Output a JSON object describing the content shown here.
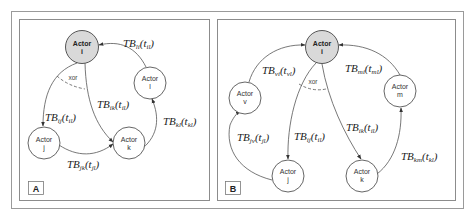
{
  "figure": {
    "panels": [
      {
        "id": "A",
        "tag": "A",
        "xor_label": "xor",
        "nodes": [
          {
            "id": "i",
            "line1": "Actor",
            "line2": "i",
            "focal": true
          },
          {
            "id": "l",
            "line1": "Actor",
            "line2": "l",
            "focal": false
          },
          {
            "id": "j",
            "line1": "Actor",
            "line2": "j",
            "focal": false
          },
          {
            "id": "k",
            "line1": "Actor",
            "line2": "k",
            "focal": false
          }
        ],
        "edges": [
          {
            "from": "l",
            "to": "i",
            "base": "TB",
            "sub": "li",
            "arg": "t",
            "argsub": "il"
          },
          {
            "from": "i",
            "to": "j",
            "base": "TB",
            "sub": "ij",
            "arg": "t",
            "argsub": "il"
          },
          {
            "from": "i",
            "to": "k",
            "base": "TB",
            "sub": "ik",
            "arg": "t",
            "argsub": "il"
          },
          {
            "from": "j",
            "to": "k",
            "base": "TB",
            "sub": "jk",
            "arg": "t",
            "argsub": "jl"
          },
          {
            "from": "k",
            "to": "l",
            "base": "TB",
            "sub": "kl",
            "arg": "t",
            "argsub": "kl"
          }
        ]
      },
      {
        "id": "B",
        "tag": "B",
        "xor_label": "xor",
        "nodes": [
          {
            "id": "i",
            "line1": "Actor",
            "line2": "i",
            "focal": true
          },
          {
            "id": "v",
            "line1": "Actor",
            "line2": "v",
            "focal": false
          },
          {
            "id": "m",
            "line1": "Actor",
            "line2": "m",
            "focal": false
          },
          {
            "id": "j",
            "line1": "Actor",
            "line2": "j",
            "focal": false
          },
          {
            "id": "k",
            "line1": "Actor",
            "line2": "k",
            "focal": false
          }
        ],
        "edges": [
          {
            "from": "v",
            "to": "i",
            "base": "TB",
            "sub": "vi",
            "arg": "t",
            "argsub": "vl"
          },
          {
            "from": "m",
            "to": "i",
            "base": "TB",
            "sub": "mi",
            "arg": "t",
            "argsub": "ml"
          },
          {
            "from": "i",
            "to": "j",
            "base": "TB",
            "sub": "ij",
            "arg": "t",
            "argsub": "il"
          },
          {
            "from": "i",
            "to": "k",
            "base": "TB",
            "sub": "ik",
            "arg": "t",
            "argsub": "il"
          },
          {
            "from": "j",
            "to": "v",
            "base": "TB",
            "sub": "jv",
            "arg": "t",
            "argsub": "jl"
          },
          {
            "from": "k",
            "to": "m",
            "base": "TB",
            "sub": "km",
            "arg": "t",
            "argsub": "kl"
          }
        ]
      }
    ],
    "colors": {
      "focal_fill": "#d9d9d9",
      "node_fill": "#ffffff",
      "stroke": "#555555",
      "frame": "#9a9a9a"
    }
  }
}
